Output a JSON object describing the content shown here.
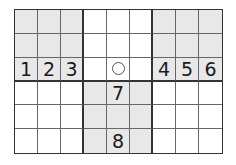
{
  "puzzle": {
    "type": "sudoku-fragment",
    "columns": 9,
    "rows": 6,
    "box_width": 3,
    "box_height": 3,
    "shade_color": "#e8e8e8",
    "shaded_boxes": [
      [
        0,
        0
      ],
      [
        0,
        2
      ],
      [
        1,
        1
      ]
    ],
    "cells": [
      [
        "",
        "",
        "",
        "",
        "",
        "",
        "",
        "",
        ""
      ],
      [
        "",
        "",
        "",
        "",
        "",
        "",
        "",
        "",
        ""
      ],
      [
        "1",
        "2",
        "3",
        "",
        "○",
        "",
        "4",
        "5",
        "6"
      ],
      [
        "",
        "",
        "",
        "",
        "7",
        "",
        "",
        "",
        ""
      ],
      [
        "",
        "",
        "",
        "",
        "",
        "",
        "",
        "",
        ""
      ],
      [
        "",
        "",
        "",
        "",
        "8",
        "",
        "",
        "",
        ""
      ]
    ],
    "marked_cell": {
      "row": 2,
      "col": 4,
      "icon": "circle-icon"
    }
  }
}
